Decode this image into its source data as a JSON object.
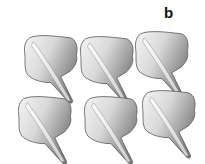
{
  "figure": {
    "panel_label": "b",
    "grid": {
      "rows": 2,
      "cols": 3
    },
    "specimens": [
      {
        "row": 0,
        "col": 0,
        "x": 20,
        "y": 32
      },
      {
        "row": 0,
        "col": 1,
        "x": 76,
        "y": 33
      },
      {
        "row": 0,
        "col": 2,
        "x": 131,
        "y": 28
      },
      {
        "row": 1,
        "col": 0,
        "x": 14,
        "y": 93
      },
      {
        "row": 1,
        "col": 1,
        "x": 80,
        "y": 93
      },
      {
        "row": 1,
        "col": 2,
        "x": 138,
        "y": 87
      }
    ],
    "colors": {
      "light": "#f2f2f2",
      "mid": "#bdbdbd",
      "dark": "#6e6e6e",
      "outline": "#555555"
    }
  }
}
